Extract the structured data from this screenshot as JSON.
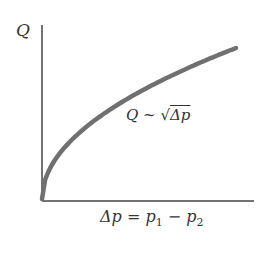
{
  "chart_data": {
    "type": "line",
    "title": "",
    "ylabel": "Q",
    "xlabel": "Δp = p₁ − p₂",
    "annotation": "Q ~ √Δp",
    "grid": false,
    "legend": null,
    "series": [
      {
        "name": "Q ~ √Δp",
        "function": "sqrt",
        "x": [
          0,
          0.05,
          0.1,
          0.2,
          0.3,
          0.4,
          0.5,
          0.6,
          0.7,
          0.8,
          0.9,
          1.0
        ],
        "values": [
          0,
          0.224,
          0.316,
          0.447,
          0.548,
          0.632,
          0.707,
          0.775,
          0.837,
          0.894,
          0.949,
          1.0
        ]
      }
    ],
    "xlim": [
      0,
      1.07
    ],
    "ylim": [
      0,
      1.16
    ],
    "ticks": "none"
  },
  "labels": {
    "y_axis": "Q",
    "annotation_q": "Q",
    "annotation_sim": "~",
    "annotation_root_arg": "Δp",
    "x_axis_lhs": "Δp = ",
    "x_p1": "p",
    "x_sub1": "1",
    "x_minus": " − ",
    "x_p2": "p",
    "x_sub2": "2"
  }
}
